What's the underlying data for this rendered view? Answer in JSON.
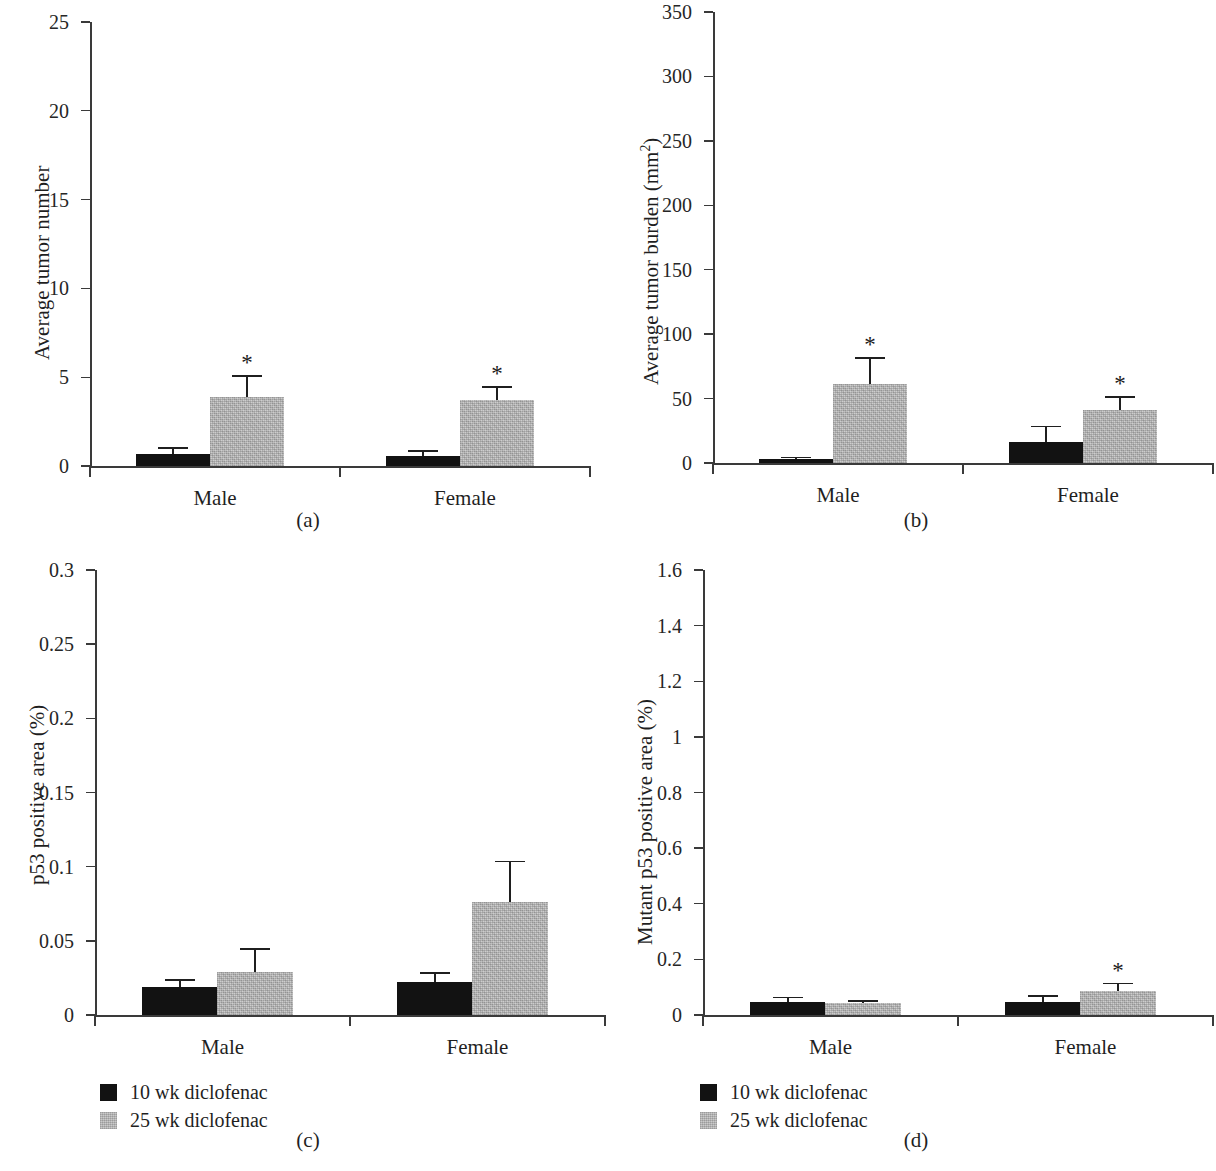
{
  "figure": {
    "panel_captions": [
      "(a)",
      "(b)",
      "(c)",
      "(d)"
    ],
    "colors": {
      "series_10wk": "#121212",
      "series_25wk": "#bfbfbf",
      "axis": "#3a3a3a",
      "text": "#1f1f1f",
      "background": "#ffffff"
    },
    "legend_labels": [
      "10 wk diclofenac",
      "25 wk diclofenac"
    ],
    "significance_marker": "*"
  },
  "chart_data": [
    {
      "type": "bar",
      "panel": "(a)",
      "title": "",
      "xlabel": "",
      "ylabel": "Average tumor number",
      "categories": [
        "Male",
        "Female"
      ],
      "ylim": [
        0,
        25
      ],
      "yticks": [
        0,
        5,
        10,
        15,
        20,
        25
      ],
      "ytick_labels": [
        "0",
        "5",
        "10",
        "15",
        "20",
        "25"
      ],
      "grid": false,
      "legend_position": "below-left",
      "series": [
        {
          "name": "10 wk diclofenac",
          "color": "#121212",
          "values": [
            0.7,
            0.55
          ],
          "errors": [
            0.35,
            0.35
          ],
          "significant": [
            false,
            false
          ]
        },
        {
          "name": "25 wk diclofenac",
          "color": "#bfbfbf",
          "values": [
            3.9,
            3.7
          ],
          "errors": [
            1.2,
            0.8
          ],
          "significant": [
            true,
            true
          ]
        }
      ]
    },
    {
      "type": "bar",
      "panel": "(b)",
      "title": "",
      "xlabel": "",
      "ylabel": "Average tumor burden (mm2)",
      "ylabel_base": "Average tumor burden (mm",
      "ylabel_sup": "2",
      "ylabel_tail": ")",
      "categories": [
        "Male",
        "Female"
      ],
      "ylim": [
        0,
        350
      ],
      "yticks": [
        0,
        50,
        100,
        150,
        200,
        250,
        300,
        350
      ],
      "ytick_labels": [
        "0",
        "50",
        "100",
        "150",
        "200",
        "250",
        "300",
        "350"
      ],
      "grid": false,
      "legend_position": "none",
      "series": [
        {
          "name": "10 wk diclofenac",
          "color": "#121212",
          "values": [
            3,
            16
          ],
          "errors": [
            2,
            13
          ],
          "significant": [
            false,
            false
          ]
        },
        {
          "name": "25 wk diclofenac",
          "color": "#bfbfbf",
          "values": [
            61,
            41
          ],
          "errors": [
            21,
            11
          ],
          "significant": [
            true,
            true
          ]
        }
      ]
    },
    {
      "type": "bar",
      "panel": "(c)",
      "title": "",
      "xlabel": "",
      "ylabel": "p53 positive area (%)",
      "categories": [
        "Male",
        "Female"
      ],
      "ylim": [
        0,
        0.3
      ],
      "yticks": [
        0,
        0.05,
        0.1,
        0.15,
        0.2,
        0.25,
        0.3
      ],
      "ytick_labels": [
        "0",
        "0.05",
        "0.1",
        "0.15",
        "0.2",
        "0.25",
        "0.3"
      ],
      "grid": false,
      "legend_position": "below-left",
      "series": [
        {
          "name": "10 wk diclofenac",
          "color": "#121212",
          "values": [
            0.019,
            0.022
          ],
          "errors": [
            0.005,
            0.007
          ],
          "significant": [
            false,
            false
          ]
        },
        {
          "name": "25 wk diclofenac",
          "color": "#bfbfbf",
          "values": [
            0.029,
            0.076
          ],
          "errors": [
            0.016,
            0.028
          ],
          "significant": [
            false,
            false
          ]
        }
      ]
    },
    {
      "type": "bar",
      "panel": "(d)",
      "title": "",
      "xlabel": "",
      "ylabel": "Mutant p53 positive area (%)",
      "categories": [
        "Male",
        "Female"
      ],
      "ylim": [
        0,
        1.6
      ],
      "yticks": [
        0,
        0.2,
        0.4,
        0.6,
        0.8,
        1,
        1.2,
        1.4,
        1.6
      ],
      "ytick_labels": [
        "0",
        "0.2",
        "0.4",
        "0.6",
        "0.8",
        "1",
        "1.2",
        "1.4",
        "1.6"
      ],
      "grid": false,
      "legend_position": "below-left",
      "series": [
        {
          "name": "10 wk diclofenac",
          "color": "#121212",
          "values": [
            0.048,
            0.048
          ],
          "errors": [
            0.018,
            0.023
          ],
          "significant": [
            false,
            false
          ]
        },
        {
          "name": "25 wk diclofenac",
          "color": "#bfbfbf",
          "values": [
            0.042,
            0.088
          ],
          "errors": [
            0.012,
            0.028
          ],
          "significant": [
            false,
            true
          ]
        }
      ]
    }
  ]
}
